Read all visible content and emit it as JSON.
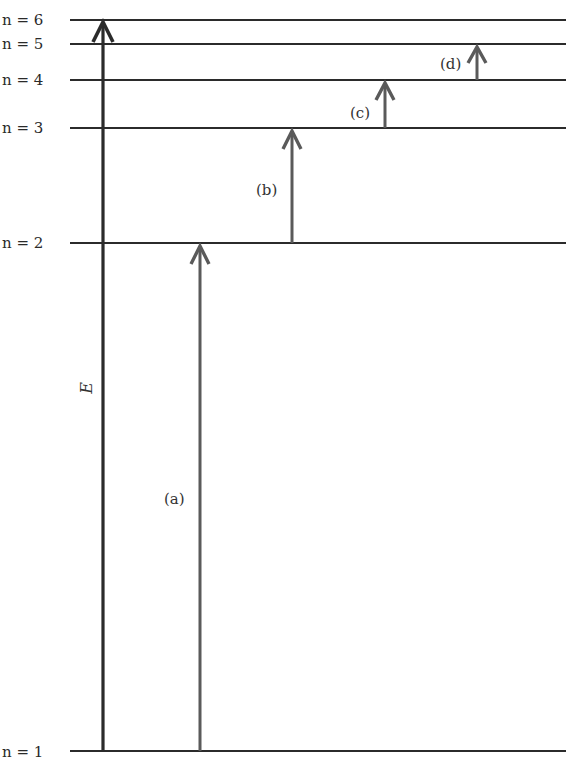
{
  "diagram": {
    "axis_label": "E",
    "levels": [
      {
        "n": 1,
        "label": "n = 1",
        "y": 751
      },
      {
        "n": 2,
        "label": "n = 2",
        "y": 243
      },
      {
        "n": 3,
        "label": "n = 3",
        "y": 128
      },
      {
        "n": 4,
        "label": "n = 4",
        "y": 80
      },
      {
        "n": 5,
        "label": "n = 5",
        "y": 44
      },
      {
        "n": 6,
        "label": "n = 6",
        "y": 20
      }
    ],
    "transitions": [
      {
        "label": "(a)",
        "from": 1,
        "to": 2,
        "x": 200
      },
      {
        "label": "(b)",
        "from": 2,
        "to": 3,
        "x": 292
      },
      {
        "label": "(c)",
        "from": 3,
        "to": 4,
        "x": 385
      },
      {
        "label": "(d)",
        "from": 4,
        "to": 5,
        "x": 477
      }
    ],
    "colors": {
      "level_line": "#2b2b2b",
      "energy_axis": "#2b2b2b",
      "transition_arrow": "#5a5a5a"
    }
  },
  "labels": {
    "n6": "n = 6",
    "n5": "n = 5",
    "n4": "n = 4",
    "n3": "n = 3",
    "n2": "n = 2",
    "n1": "n = 1",
    "a": "(a)",
    "b": "(b)",
    "c": "(c)",
    "d": "(d)",
    "E": "E"
  }
}
